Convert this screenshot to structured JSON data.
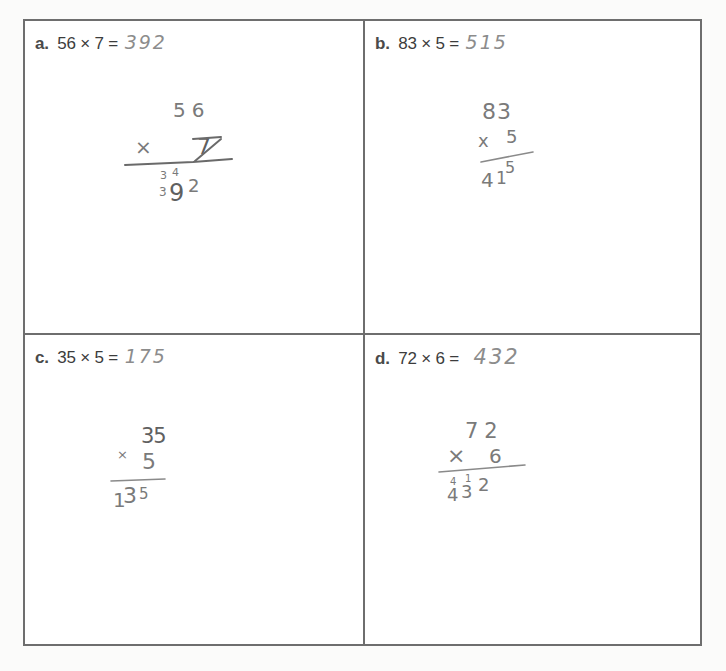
{
  "worksheet": {
    "problems": [
      {
        "id": "a",
        "label": "a.",
        "expression": "56 × 7 =",
        "written_answer": "392",
        "work": {
          "top": "56",
          "operator": "×",
          "multiplier": "7",
          "carry_marks": [
            "3",
            "4"
          ],
          "product": "392",
          "extra_digit": "3"
        }
      },
      {
        "id": "b",
        "label": "b.",
        "expression": "83 × 5 =",
        "written_answer": "515",
        "work": {
          "top": "83",
          "operator": "x",
          "multiplier": "5",
          "carry_marks": [
            "1"
          ],
          "product": "415",
          "product_parts": [
            "4",
            "1",
            "5"
          ]
        }
      },
      {
        "id": "c",
        "label": "c.",
        "expression": "35 × 5 =",
        "written_answer": "175",
        "work": {
          "top": "35",
          "operator": "×",
          "multiplier": "5",
          "product": "135",
          "product_parts": [
            "1",
            "3",
            "5"
          ]
        }
      },
      {
        "id": "d",
        "label": "d.",
        "expression": "72 × 6 =",
        "written_answer": "432",
        "work": {
          "top": "72",
          "operator": "×",
          "multiplier": "6",
          "carry_marks": [
            "4",
            "1"
          ],
          "product": "432",
          "product_parts": [
            "4",
            "3",
            "2"
          ]
        }
      }
    ]
  },
  "colors": {
    "border": "#6e6e6e",
    "printed_text": "#3c3c3c",
    "pencil": "#7a7a7a",
    "background": "#ffffff"
  }
}
